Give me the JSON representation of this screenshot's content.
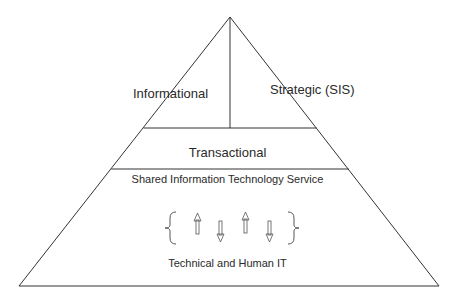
{
  "diagram": {
    "type": "pyramid",
    "layers": [
      {
        "id": "top-left",
        "label": "Informational"
      },
      {
        "id": "top-right",
        "label": "Strategic (SIS)"
      },
      {
        "id": "middle",
        "label": "Transactional"
      },
      {
        "id": "base",
        "label": "Shared Information Technology Service",
        "sublabel": "Technical and Human IT"
      }
    ],
    "icons": [
      "left-brace-icon",
      "arrow-up-icon",
      "arrow-down-icon",
      "arrow-up-icon",
      "arrow-down-icon",
      "right-brace-icon"
    ],
    "colors": {
      "line": "#333333",
      "text": "#2a2a2a",
      "background": "#ffffff"
    }
  }
}
